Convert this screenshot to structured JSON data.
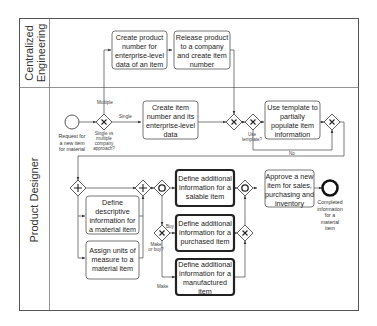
{
  "diagram": {
    "type": "bpmn-process",
    "lanes": [
      {
        "id": "lane-ce",
        "label": "Centralized Engineering"
      },
      {
        "id": "lane-pd",
        "label": "Product Designer"
      }
    ],
    "lane_ce_line1": "Centralized",
    "lane_ce_line2": "Engineering",
    "lane_pd_label": "Product Designer",
    "start_event": {
      "label_lines": [
        "Request for",
        "a new item",
        "for material"
      ]
    },
    "end_event": {
      "label_lines": [
        "Completed",
        "information",
        "for a",
        "material",
        "item"
      ]
    },
    "tasks": {
      "create_product_number": [
        "Create product",
        "number for",
        "enterprise-level",
        "data of an item"
      ],
      "release_product": [
        "Release product",
        "to a company",
        "and create item",
        "number"
      ],
      "create_item_number": [
        "Create item",
        "number and its",
        "enterprise-level",
        "data"
      ],
      "use_template": [
        "Use template to",
        "partially",
        "populate  item",
        "information"
      ],
      "define_descriptive": [
        "Define",
        "descriptive",
        "information for",
        "a material item"
      ],
      "assign_units": [
        "Assign units of",
        "measure to a",
        "material item"
      ],
      "define_salable": [
        "Define additional",
        "information for a",
        "salable item"
      ],
      "define_purchased": [
        "Define additional",
        "information for a",
        "purchased item"
      ],
      "define_manufactured": [
        "Define additional",
        "information for a",
        "manufactured",
        "item"
      ],
      "approve_item": [
        "Approve a new",
        "item for sales,",
        "purchasing and",
        "inventory"
      ]
    },
    "gateways": {
      "single_vs_multiple": {
        "type": "exclusive",
        "label_lines": [
          "Single vs",
          "multiple",
          "company",
          "approach?"
        ]
      },
      "merge_company": {
        "type": "exclusive"
      },
      "use_template": {
        "type": "exclusive",
        "label_lines": [
          "Use",
          "template?"
        ]
      },
      "merge_template": {
        "type": "exclusive"
      },
      "parallel_split": {
        "type": "parallel"
      },
      "parallel_join": {
        "type": "parallel"
      },
      "inclusive_split": {
        "type": "inclusive"
      },
      "make_or_buy": {
        "type": "exclusive",
        "label_lines": [
          "Make",
          "or buy?"
        ]
      },
      "merge_make_buy": {
        "type": "exclusive"
      },
      "inclusive_join": {
        "type": "inclusive"
      }
    },
    "flow_labels": {
      "multiple": "Multiple",
      "single": "Single",
      "buy": "Buy",
      "make": "Make",
      "no": "No"
    }
  }
}
